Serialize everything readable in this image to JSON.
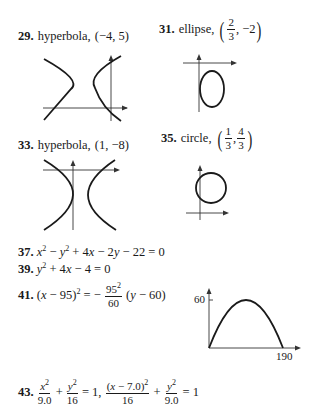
{
  "problems": [
    {
      "number": "29.",
      "type": "hyperbola,",
      "point": "(−4, 5)"
    },
    {
      "number": "31.",
      "type": "ellipse,",
      "point": {
        "x_num": "2",
        "x_den": "3",
        "y": "−2"
      }
    },
    {
      "number": "33.",
      "type": "hyperbola,",
      "point": "(1, −8)"
    },
    {
      "number": "35.",
      "type": "circle,",
      "point": {
        "x_num": "1",
        "x_den": "3",
        "y_num": "4",
        "y_den": "3"
      }
    },
    {
      "number": "37.",
      "equation": {
        "a": "x",
        "b": "2",
        "c": " − ",
        "d": "y",
        "e": "2",
        "f": " + 4",
        "g": "x",
        "h": " − 2",
        "i": "y",
        "j": " − 22 = 0"
      }
    },
    {
      "number": "39.",
      "equation": {
        "a": "y",
        "b": "2",
        "c": " + 4",
        "d": "x",
        "e": " − 4 = 0"
      }
    },
    {
      "number": "41.",
      "equation": {
        "lhs_open": "(",
        "x": "x",
        "lhs_rest": " − 95)",
        "lhs_exp": "2",
        "eq": " = −",
        "frac_num": "95",
        "frac_num_exp": "2",
        "frac_den": "60",
        "rhs_open": " (",
        "y": "y",
        "rhs_rest": " − 60)"
      }
    },
    {
      "number": "43.",
      "equation": {
        "t1_num_var": "x",
        "t1_num_exp": "2",
        "t1_den": "9.0",
        "plus1": "+",
        "t2_num_var": "y",
        "t2_num_exp": "2",
        "t2_den": "16",
        "sep": "= 1,",
        "t3_num_open": "(",
        "t3_num_var": "x",
        "t3_num_rest": " − 7.0)",
        "t3_num_exp": "2",
        "t3_den": "16",
        "plus2": "+",
        "t4_num_var": "y",
        "t4_num_exp": "2",
        "t4_den": "9.0",
        "end": "= 1"
      }
    }
  ],
  "graphs": {
    "graph41": {
      "y_tick": "60",
      "x_tick": "190"
    }
  }
}
